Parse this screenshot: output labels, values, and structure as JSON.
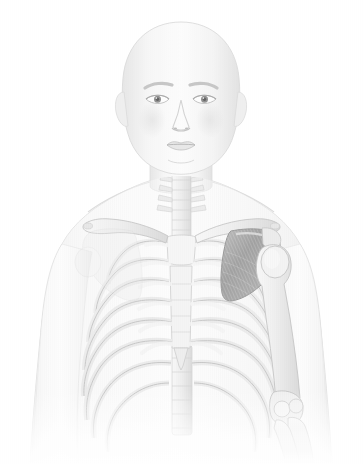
{
  "image": {
    "title": "Anterior view of human upper body skeleton with highlighted left scapula",
    "subject": "Human male upper torso, anterior (frontal) view",
    "style": "grayscale medical illustration, semi-transparent body silhouette over skeletal anatomy",
    "width": 363,
    "height": 464,
    "background_color": "#ffffff",
    "alt_text": "Grayscale anatomical illustration of a bald human upper body seen from the front. The skin is rendered semi-transparent so the rib cage, clavicles, sternum, spine and arm bones show through. The left scapula (on the viewer's right) is shaded dark charcoal to highlight it."
  },
  "palette": {
    "background": "#ffffff",
    "skin_light": "#f4f4f4",
    "skin_mid": "#e8e8e8",
    "skin_shadow": "#d8d8d8",
    "body_outline": "#cfcfcf",
    "bone_light": "#e4e4e4",
    "bone_mid": "#c2c2c2",
    "bone_outline": "#8d8d8d",
    "cartilage": "#d5d5d5",
    "highlight_scapula_dark": "#3a3a3a",
    "highlight_scapula_mid": "#5f5f5f",
    "highlight_scapula_light": "#8a8a8a",
    "facial_feature": "#9a9a9a",
    "eye_iris": "#6e6e6e",
    "eye_pupil": "#2f2f2f",
    "brow": "#b0b0b0"
  },
  "anatomy": {
    "highlighted_structure": "left scapula",
    "regions": [
      {
        "id": "head",
        "label": "Head / cranium",
        "note": "bald, smooth cranial vault"
      },
      {
        "id": "face",
        "label": "Face",
        "note": "eyebrows, eyes, nose, lips, chin"
      },
      {
        "id": "neck",
        "label": "Neck",
        "note": "cervical vertebrae visible through skin"
      },
      {
        "id": "shoulders",
        "label": "Shoulders / deltoids",
        "note": "both deltoid contours"
      },
      {
        "id": "thorax",
        "label": "Thorax",
        "note": "rib cage and sternum"
      },
      {
        "id": "left-arm",
        "label": "Left upper limb",
        "note": "humerus, elbow, radius and ulna"
      },
      {
        "id": "right-arm",
        "label": "Right upper limb",
        "note": "silhouette only, bones faded"
      },
      {
        "id": "abdomen",
        "label": "Upper abdomen",
        "note": "fades out toward bottom of frame"
      }
    ],
    "bones": [
      {
        "id": "cervical-spine",
        "label": "Cervical vertebrae",
        "count": 7,
        "highlighted": false
      },
      {
        "id": "thoracic-spine",
        "label": "Thoracic vertebrae",
        "count": 12,
        "highlighted": false
      },
      {
        "id": "clavicle-right",
        "label": "Right clavicle",
        "count": 1,
        "highlighted": false
      },
      {
        "id": "clavicle-left",
        "label": "Left clavicle",
        "count": 1,
        "highlighted": false
      },
      {
        "id": "scapula-left",
        "label": "Left scapula",
        "count": 1,
        "highlighted": true
      },
      {
        "id": "manubrium",
        "label": "Manubrium of sternum",
        "count": 1,
        "highlighted": false
      },
      {
        "id": "sternum-body",
        "label": "Body of sternum",
        "count": 1,
        "highlighted": false
      },
      {
        "id": "xiphoid",
        "label": "Xiphoid process",
        "count": 1,
        "highlighted": false
      },
      {
        "id": "ribs",
        "label": "Ribs",
        "count": 24,
        "highlighted": false
      },
      {
        "id": "costal-cartilage",
        "label": "Costal cartilages",
        "count": 14,
        "highlighted": false
      },
      {
        "id": "humerus-left",
        "label": "Left humerus",
        "count": 1,
        "highlighted": false
      },
      {
        "id": "radius-left",
        "label": "Left radius",
        "count": 1,
        "highlighted": false
      },
      {
        "id": "ulna-left",
        "label": "Left ulna",
        "count": 1,
        "highlighted": false
      }
    ]
  }
}
